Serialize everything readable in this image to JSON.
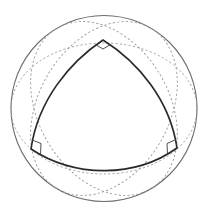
{
  "diagram": {
    "title": "",
    "colors": {
      "sphere_outline": "#6e6e6e",
      "great_circles": "#9a9a9a",
      "triangle": "#2a2a2a",
      "right_angle_markers": "#3a3a3a",
      "background": "#ffffff"
    },
    "sphere": {
      "cx": 104,
      "cy": 108.5,
      "r": 93
    },
    "great_circles": [
      {
        "name": "great-circle-bottom",
        "rx": 93,
        "ry": 65.5,
        "rotation_deg": 0
      },
      {
        "name": "great-circle-left",
        "rx": 93,
        "ry": 65.5,
        "rotation_deg": 60
      },
      {
        "name": "great-circle-right",
        "rx": 93,
        "ry": 65.5,
        "rotation_deg": -60
      }
    ],
    "triangle": {
      "vertices": {
        "top": [
          103,
          40
        ],
        "left": [
          31,
          149
        ],
        "right": [
          177,
          148
        ]
      },
      "angles_deg": [
        90,
        90,
        90
      ]
    },
    "right_angle_markers": [
      "top",
      "left",
      "right"
    ],
    "labels": []
  }
}
